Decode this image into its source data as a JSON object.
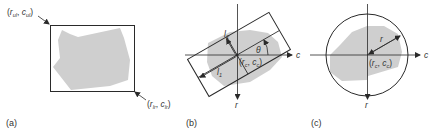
{
  "panels": [
    {
      "id": "a",
      "caption": "(a)",
      "description": "Axis-aligned bounding box around region",
      "labels": {
        "upper_left": {
          "var1": "r",
          "sub1": "ul",
          "var2": "c",
          "sub2": "ul"
        },
        "lower_right": {
          "var1": "r",
          "sub1": "lr",
          "var2": "c",
          "sub2": "lr"
        }
      }
    },
    {
      "id": "b",
      "caption": "(b)",
      "description": "Oriented bounding box with axes lengths and angle",
      "labels": {
        "l1": "l",
        "l1_sub": "1",
        "l2": "l",
        "l2_sub": "2",
        "angle": "θ",
        "center": {
          "var1": "r",
          "sub1": "c",
          "var2": "c",
          "sub2": "c"
        },
        "x_axis": "c",
        "y_axis": "r"
      }
    },
    {
      "id": "c",
      "caption": "(c)",
      "description": "Bounding circle with center and radius",
      "labels": {
        "radius": "r",
        "center": {
          "var1": "r",
          "sub1": "c",
          "var2": "c",
          "sub2": "c"
        },
        "x_axis_left": "c",
        "x_axis": "c",
        "y_axis": "r"
      }
    }
  ],
  "colors": {
    "region_fill": "#cfcfcf",
    "stroke": "#2a2a2a",
    "text": "#333333"
  }
}
